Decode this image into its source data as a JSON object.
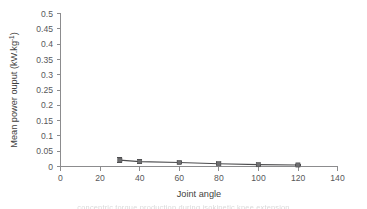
{
  "figure": {
    "background": "#ffffff",
    "line_color": "#4d4d4f",
    "marker_color": "#6f6f71",
    "axis_color": "#8c8c8e",
    "text_color": "#58585a",
    "caption_sliver": "concentric torque production during isokinetic knee extension"
  },
  "chart_data": {
    "type": "line",
    "title": "",
    "xlabel": "Joint angle",
    "ylabel": "Mean power ouput (kW.kg",
    "ylabel_superscript": "-1",
    "ylabel_suffix": ")",
    "x": [
      30,
      40,
      60,
      80,
      100,
      120
    ],
    "values": [
      0.021,
      0.016,
      0.013,
      0.009,
      0.006,
      0.005
    ],
    "errors": [
      0.008,
      0.006,
      0.004,
      0.003,
      0.002,
      0.002
    ],
    "series": [
      {
        "name": "Mean power output",
        "x": [
          30,
          40,
          60,
          80,
          100,
          120
        ],
        "values": [
          0.021,
          0.016,
          0.013,
          0.009,
          0.006,
          0.005
        ],
        "errors": [
          0.008,
          0.006,
          0.004,
          0.003,
          0.002,
          0.002
        ]
      }
    ],
    "xlim": [
      0,
      140
    ],
    "ylim": [
      0,
      0.5
    ],
    "xticks": [
      0,
      20,
      40,
      60,
      80,
      100,
      120,
      140
    ],
    "xtick_labels": [
      "0",
      "20",
      "40",
      "60",
      "80",
      "100",
      "120",
      "140"
    ],
    "yticks": [
      0,
      0.05,
      0.1,
      0.15,
      0.2,
      0.25,
      0.3,
      0.35,
      0.4,
      0.45,
      0.5
    ],
    "ytick_labels": [
      "0",
      "0.05",
      "0.1",
      "0.15",
      "0.2",
      "0.25",
      "0.3",
      "0.35",
      "0.4",
      "0.45",
      "0.5"
    ],
    "grid": false,
    "legend": false,
    "legend_position": "none",
    "marker": "square",
    "error_bars": true
  }
}
